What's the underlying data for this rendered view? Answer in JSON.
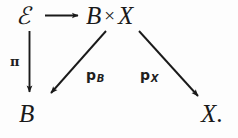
{
  "diagram": {
    "type": "commutative-diagram",
    "ink_color": "#1a1a1a",
    "background_color": "#fdfdfd",
    "nodes": [
      {
        "id": "z",
        "label": "ℰ",
        "role": "source-object",
        "position": "top-left"
      },
      {
        "id": "b-times-x",
        "label_left": "B",
        "label_operator": "×",
        "label_right": "X",
        "role": "product-object",
        "position": "top-right"
      },
      {
        "id": "b-bottom",
        "label": "B",
        "role": "target-object",
        "position": "bottom-left"
      },
      {
        "id": "x-bottom",
        "label": "X",
        "label_suffix": ".",
        "role": "target-object",
        "position": "bottom-right"
      }
    ],
    "arrows": [
      {
        "id": "z-to-bx",
        "from": "z",
        "to": "b-times-x",
        "direction": "right",
        "label": ""
      },
      {
        "id": "z-to-b",
        "from": "z",
        "to": "b-bottom",
        "direction": "down",
        "label_base": "π",
        "label_sub": ""
      },
      {
        "id": "bx-to-b",
        "from": "b-times-x",
        "to": "b-bottom",
        "direction": "down-left",
        "label_base": "p",
        "label_sub": "B"
      },
      {
        "id": "bx-to-x",
        "from": "b-times-x",
        "to": "x-bottom",
        "direction": "down-right",
        "label_base": "p",
        "label_sub": "X"
      }
    ]
  }
}
